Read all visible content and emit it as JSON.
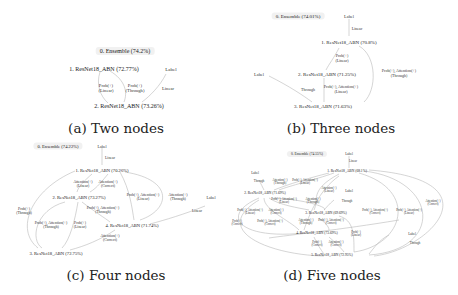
{
  "figure": {
    "panels": [
      {
        "id": "a",
        "caption": "(a) Two nodes",
        "nodes": [
          {
            "id": 0,
            "label": "0. Ensemble (74.2%)"
          },
          {
            "id": 1,
            "label": "1. ResNet18_ABN (72.77%)"
          },
          {
            "id": 2,
            "label": "2. ResNet18_ABN (73.26%)"
          }
        ],
        "sources": [
          {
            "label": "Label"
          }
        ],
        "edges": [
          {
            "from": "1",
            "to": "2",
            "label": "Prob(+)\n(Linear)"
          },
          {
            "from": "1",
            "to": "2",
            "label": "Prob(+)\n(Through)"
          },
          {
            "from": "Label",
            "to": "2",
            "label": "Linear"
          }
        ]
      },
      {
        "id": "b",
        "caption": "(b) Three nodes",
        "nodes": [
          {
            "id": 0,
            "label": "0. Ensemble (74.01%)"
          },
          {
            "id": 1,
            "label": "1. ResNet18_ABN (70.8%)"
          },
          {
            "id": 2,
            "label": "2. ResNet18_ABN (71.25%)"
          },
          {
            "id": 3,
            "label": "3. ResNet18_ABN (71.63%)"
          }
        ],
        "sources": [
          {
            "label": "Label"
          },
          {
            "label": "Label"
          }
        ],
        "edges": [
          {
            "from": "Label",
            "to": "1",
            "label": "Linear"
          },
          {
            "from": "1",
            "to": "2",
            "label": "Prob(+)\n(Linear)"
          },
          {
            "from": "1",
            "to": "3",
            "label": "Prob(+), Attention(+)\n(Through)"
          },
          {
            "from": "Label",
            "to": "3",
            "label": "Through"
          },
          {
            "from": "2",
            "to": "3",
            "label": "Prob(+), Attention(+)\n(Linear)"
          }
        ]
      },
      {
        "id": "c",
        "caption": "(c) Four nodes",
        "nodes": [
          {
            "id": 0,
            "label": "0. Ensemble (74.22%)"
          },
          {
            "id": 1,
            "label": "1. ResNet18_ABN (70.26%)"
          },
          {
            "id": 2,
            "label": "2. ResNet18_ABN (73.27%)"
          },
          {
            "id": 3,
            "label": "3. ResNet18_ABN (72.75%)"
          },
          {
            "id": 4,
            "label": "4. ResNet18_ABN (71.74%)"
          }
        ],
        "sources": [
          {
            "label": "Label"
          },
          {
            "label": "Label"
          }
        ],
        "edges": [
          {
            "from": "Label",
            "to": "1",
            "label": "Linear"
          },
          {
            "from": "1",
            "to": "2",
            "label": "Attention(+)\n(Linear)"
          },
          {
            "from": "1",
            "to": "2",
            "label": "Attention(+)\n(Correct)"
          },
          {
            "from": "1",
            "to": "4",
            "label": "Prob(+), Attention(+)\n(Linear)"
          },
          {
            "from": "1",
            "to": "4",
            "label": "Attention(+)\n(Through)"
          },
          {
            "from": "1",
            "to": "3",
            "label": "Prob(+)\n(Through)"
          },
          {
            "from": "2",
            "to": "4",
            "label": "Prob(+), Attention(+)\n(Through)"
          },
          {
            "from": "2",
            "to": "3",
            "label": "Prob(+), Attention(+)\n(Through)"
          },
          {
            "from": "2",
            "to": "3",
            "label": "Prob(+)\n(Linear)"
          },
          {
            "from": "Label",
            "to": "4",
            "label": "Linear"
          },
          {
            "from": "4",
            "to": "3",
            "label": "Attention(+)\n(Correct)"
          }
        ]
      },
      {
        "id": "d",
        "caption": "(d) Five nodes",
        "nodes": [
          {
            "id": 0,
            "label": "0. Ensemble (74.55%)"
          },
          {
            "id": 1,
            "label": "1. ResNet18_ABN (68.1%)"
          },
          {
            "id": 2,
            "label": "2. ResNet18_ABN (71.69%)"
          },
          {
            "id": 3,
            "label": "3. ResNet18_ABN (69.69%)"
          },
          {
            "id": 4,
            "label": "4. ResNet18_ABN (73.69%)"
          },
          {
            "id": 5,
            "label": "5. ResNet18_ABN (72.95%)"
          }
        ],
        "sources": [
          {
            "label": "Label"
          },
          {
            "label": "Label"
          },
          {
            "label": "Label"
          },
          {
            "label": "Label"
          }
        ],
        "edges": [
          {
            "from": "Label",
            "to": "1",
            "label": "Linear"
          },
          {
            "from": "Label",
            "to": "2",
            "label": "Through"
          },
          {
            "from": "1",
            "to": "2",
            "label": "Attention(+)\n(Through)"
          },
          {
            "from": "1",
            "to": "2",
            "label": "Prob(+), Attention(+)\n(Linear)"
          },
          {
            "from": "1",
            "to": "3",
            "label": "Attention(+)\n(Linear)"
          },
          {
            "from": "Label",
            "to": "3",
            "label": "Through"
          },
          {
            "from": "2",
            "to": "3",
            "label": "Prob(+), Attention(+)\n(Linear)"
          },
          {
            "from": "2",
            "to": "3",
            "label": "Attention(+)\n(Through)"
          },
          {
            "from": "2",
            "to": "4",
            "label": "Prob(+), Attention(+)\n(Linear)"
          },
          {
            "from": "2",
            "to": "4",
            "label": "Attention(+)\n(Correct)"
          },
          {
            "from": "2",
            "to": "4",
            "label": "Prob(+), Attention(+)\n(Correct)"
          },
          {
            "from": "2",
            "to": "5",
            "label": "Prob(+)\n(Correct)"
          },
          {
            "from": "3",
            "to": "4",
            "label": "Attention(+)\n(Through)"
          },
          {
            "from": "3",
            "to": "4",
            "label": "Prob(+), Attention(+)\n(Correct)"
          },
          {
            "from": "1",
            "to": "5",
            "label": "Prob(+), Attention(+)\n(Correct)"
          },
          {
            "from": "1",
            "to": "5",
            "label": "Prob(+), Attention(+)\n(Linear)"
          },
          {
            "from": "1",
            "to": "5",
            "label": "Attention(+)\n(Correct)"
          },
          {
            "from": "3",
            "to": "5",
            "label": "Prob(+)\n(Linear)"
          },
          {
            "from": "4",
            "to": "5",
            "label": "Prob(+)\n(Correct)"
          },
          {
            "from": "4",
            "to": "5",
            "label": "Attention(+)\n(Correct)"
          },
          {
            "from": "Label",
            "to": "5",
            "label": "Through"
          }
        ]
      }
    ]
  }
}
